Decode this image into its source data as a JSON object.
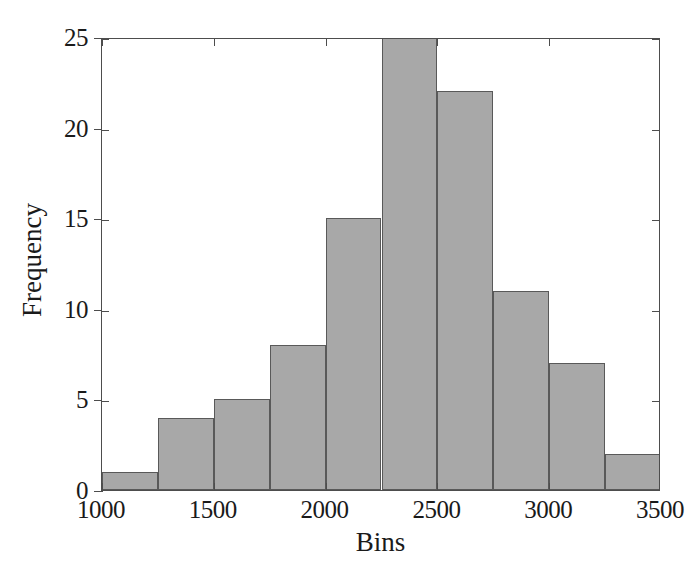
{
  "chart_data": {
    "type": "bar",
    "title": "",
    "subtitle": "",
    "xlabel": "Bins",
    "ylabel": "Frequency",
    "xlim": [
      1000,
      3500
    ],
    "ylim": [
      0,
      25
    ],
    "grid": false,
    "legend": null,
    "bin_width": 250,
    "bar_fill_color": "#a8a8a8",
    "bar_edge_color": "#595959",
    "axis_color": "#4d4d4d",
    "background_color": "#ffffff",
    "xticks": [
      1000,
      1500,
      2000,
      2500,
      3000,
      3500
    ],
    "xtick_labels": [
      "1000",
      "1500",
      "2000",
      "2500",
      "3000",
      "3500"
    ],
    "yticks": [
      0,
      5,
      10,
      15,
      20,
      25
    ],
    "ytick_labels": [
      "0",
      "5",
      "10",
      "15",
      "20",
      "25"
    ],
    "bins": [
      {
        "label": "1000–1250",
        "start": 1000,
        "end": 1250,
        "value": 1
      },
      {
        "label": "1250–1500",
        "start": 1250,
        "end": 1500,
        "value": 4
      },
      {
        "label": "1500–1750",
        "start": 1500,
        "end": 1750,
        "value": 5
      },
      {
        "label": "1750–2000",
        "start": 1750,
        "end": 2000,
        "value": 8
      },
      {
        "label": "2000–2250",
        "start": 2000,
        "end": 2250,
        "value": 15
      },
      {
        "label": "2250–2500",
        "start": 2250,
        "end": 2500,
        "value": 25
      },
      {
        "label": "2500–2750",
        "start": 2500,
        "end": 2750,
        "value": 22
      },
      {
        "label": "2750–3000",
        "start": 2750,
        "end": 3000,
        "value": 11
      },
      {
        "label": "3000–3250",
        "start": 3000,
        "end": 3250,
        "value": 7
      },
      {
        "label": "3250–3500",
        "start": 3250,
        "end": 3500,
        "value": 2
      }
    ],
    "categories": [
      "1000–1250",
      "1250–1500",
      "1500–1750",
      "1750–2000",
      "2000–2250",
      "2250–2500",
      "2500–2750",
      "2750–3000",
      "3000–3250",
      "3250–3500"
    ],
    "values": [
      1,
      4,
      5,
      8,
      15,
      25,
      22,
      11,
      7,
      2
    ]
  }
}
